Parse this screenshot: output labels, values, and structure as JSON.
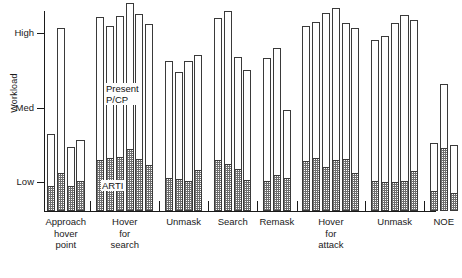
{
  "chart_data": {
    "type": "bar",
    "title": "",
    "xlabel": "",
    "ylabel": "Workload",
    "grid": false,
    "legend": "in-plot annotations",
    "y_tick_labels": [
      "High",
      "Med",
      "Low"
    ],
    "y_tick_values": [
      3,
      2,
      1
    ],
    "ylim": [
      0,
      3.45
    ],
    "stack_order": [
      "ARTI",
      "Present P/CP"
    ],
    "annotations": [
      {
        "text": "Present\nP/CP",
        "x_px": 105,
        "y_px": 83
      },
      {
        "text": "ARTI",
        "x_px": 101,
        "y_px": 180
      }
    ],
    "categories": [
      "Approach\nhover\npoint",
      "Hover\nfor\nsearch",
      "Unmask",
      "Search",
      "Remask",
      "Hover\nfor\nattack",
      "Unmask",
      "NOE"
    ],
    "groups": [
      {
        "label": "Approach hover point",
        "label_lines": "Approach\nhover\npoint",
        "bars": [
          {
            "arti": 0.95,
            "total": 1.64
          },
          {
            "arti": 1.12,
            "total": 3.07
          },
          {
            "arti": 0.95,
            "total": 1.47
          },
          {
            "arti": 1.02,
            "total": 1.56
          }
        ]
      },
      {
        "label": "Hover for search",
        "label_lines": "Hover\nfor\nsearch",
        "bars": [
          {
            "arti": 1.3,
            "total": 3.22
          },
          {
            "arti": 1.32,
            "total": 3.1
          },
          {
            "arti": 1.33,
            "total": 3.23
          },
          {
            "arti": 1.44,
            "total": 3.4
          },
          {
            "arti": 1.31,
            "total": 3.26
          },
          {
            "arti": 1.23,
            "total": 3.12
          }
        ]
      },
      {
        "label": "Unmask",
        "label_lines": "Unmask",
        "bars": [
          {
            "arti": 1.06,
            "total": 2.62
          },
          {
            "arti": 1.04,
            "total": 2.48
          },
          {
            "arti": 1.02,
            "total": 2.62
          },
          {
            "arti": 1.16,
            "total": 2.7
          }
        ]
      },
      {
        "label": "Search",
        "label_lines": "Search",
        "bars": [
          {
            "arti": 1.3,
            "total": 3.2
          },
          {
            "arti": 1.24,
            "total": 3.3
          },
          {
            "arti": 1.18,
            "total": 2.68
          },
          {
            "arti": 1.03,
            "total": 2.5
          }
        ]
      },
      {
        "label": "Remask",
        "label_lines": "Remask",
        "bars": [
          {
            "arti": 1.01,
            "total": 2.66
          },
          {
            "arti": 1.1,
            "total": 2.8
          },
          {
            "arti": 1.06,
            "total": 1.96
          }
        ]
      },
      {
        "label": "Hover for attack",
        "label_lines": "Hover\nfor\nattack",
        "bars": [
          {
            "arti": 1.28,
            "total": 3.1
          },
          {
            "arti": 1.32,
            "total": 3.15
          },
          {
            "arti": 1.2,
            "total": 3.27
          },
          {
            "arti": 1.3,
            "total": 3.34
          },
          {
            "arti": 1.31,
            "total": 3.13
          },
          {
            "arti": 1.12,
            "total": 3.07
          }
        ]
      },
      {
        "label": "Unmask",
        "label_lines": "Unmask",
        "bars": [
          {
            "arti": 1.02,
            "total": 2.9
          },
          {
            "arti": 1.0,
            "total": 2.96
          },
          {
            "arti": 1.0,
            "total": 3.14
          },
          {
            "arti": 1.02,
            "total": 3.24
          },
          {
            "arti": 1.15,
            "total": 3.18
          }
        ]
      },
      {
        "label": "NOE",
        "label_lines": "NOE",
        "bars": [
          {
            "arti": 0.88,
            "total": 1.52
          },
          {
            "arti": 1.45,
            "total": 2.32
          },
          {
            "arti": 0.85,
            "total": 1.5
          }
        ]
      }
    ]
  },
  "axis": {
    "y_title": "Workload"
  }
}
